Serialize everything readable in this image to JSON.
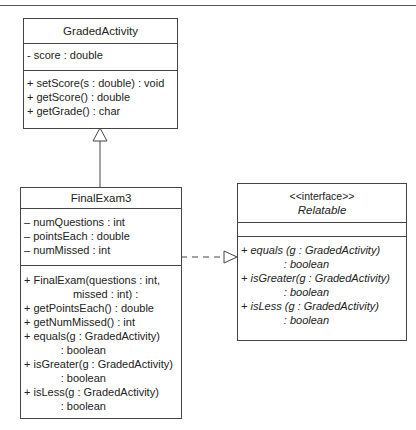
{
  "diagram": {
    "type": "UML class diagram",
    "classes": {
      "graded_activity": {
        "name": "GradedActivity",
        "attributes": [
          "- score : double"
        ],
        "methods": [
          "+ setScore(s : double) : void",
          "+ getScore() : double",
          "+ getGrade() : char"
        ]
      },
      "final_exam3": {
        "name": "FinalExam3",
        "attributes": [
          "– numQuestions : int",
          "– pointsEach : double",
          "– numMissed : int"
        ],
        "methods": [
          "+ FinalExam(questions : int,",
          "                missed : int) :",
          "+ getPointsEach() : double",
          "+ getNumMissed() : int",
          "+ equals(g : GradedActivity)",
          "            : boolean",
          "+ isGreater(g : GradedActivity)",
          "            : boolean",
          "+ isLess(g : GradedActivity)",
          "            : boolean"
        ]
      },
      "relatable": {
        "stereotype": "<<interface>>",
        "name": "Relatable",
        "attributes": [],
        "methods": [
          "+ equals (g : GradedActivity)",
          "              : boolean",
          "+ isGreater(g : GradedActivity)",
          "              : boolean",
          "+ isLess (g : GradedActivity)",
          "              : boolean"
        ]
      }
    },
    "relationships": [
      {
        "type": "inheritance",
        "from": "FinalExam3",
        "to": "GradedActivity"
      },
      {
        "type": "realization",
        "from": "FinalExam3",
        "to": "Relatable"
      }
    ]
  }
}
